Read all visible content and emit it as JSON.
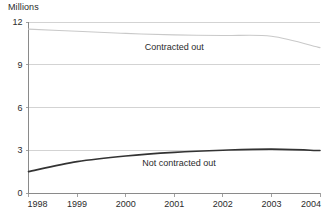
{
  "chart_data": {
    "type": "line",
    "title": "",
    "xlabel": "",
    "ylabel": "Millions",
    "unit_label": "Millions",
    "x": [
      1998,
      1999,
      2000,
      2001,
      2002,
      2003,
      2004
    ],
    "xtick_labels": [
      "1998",
      "1999",
      "2000",
      "2001",
      "2002",
      "2003",
      "2004"
    ],
    "ytick_labels": [
      "0",
      "3",
      "6",
      "9",
      "12"
    ],
    "ytick_values": [
      0,
      3,
      6,
      9,
      12
    ],
    "ylim": [
      0,
      12
    ],
    "xlim": [
      1998,
      2004
    ],
    "grid": true,
    "legend_position": "inline-annotation",
    "series": [
      {
        "name": "Contracted out",
        "label": "Contracted out",
        "color": "#c9c9c9",
        "stroke_width": 1.1,
        "values": [
          11.5,
          11.35,
          11.2,
          11.1,
          11.05,
          11.0,
          10.2
        ],
        "label_x": 2001.0,
        "label_y": 10.05
      },
      {
        "name": "Not contracted out",
        "label": "Not contracted out",
        "color": "#333333",
        "stroke_width": 1.6,
        "values": [
          1.5,
          2.2,
          2.6,
          2.85,
          3.0,
          3.08,
          2.98
        ],
        "label_x": 2001.1,
        "label_y": 1.9
      }
    ]
  },
  "colors": {
    "background": "#ffffff",
    "gridline": "#c8c8c8",
    "axis": "#8a8a8a",
    "text": "#2b2b2b",
    "series_contracted_out": "#c9c9c9",
    "series_not_contracted_out": "#333333"
  }
}
